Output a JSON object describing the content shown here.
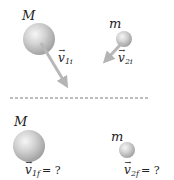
{
  "diagram": {
    "before": {
      "body_large": {
        "mass_label": "M",
        "velocity_symbol": "v",
        "velocity_subscript": "1i"
      },
      "body_small": {
        "mass_label": "m",
        "velocity_symbol": "v",
        "velocity_subscript": "2i"
      }
    },
    "separator": "dashed-line",
    "after": {
      "body_large": {
        "mass_label": "M",
        "velocity_symbol": "v",
        "velocity_subscript": "1f",
        "value": "= ?"
      },
      "body_small": {
        "mass_label": "m",
        "velocity_symbol": "v",
        "velocity_subscript": "2f",
        "value": "= ?"
      }
    },
    "colors": {
      "sphere_light": "#f4f4f4",
      "sphere_mid": "#c8c8c8",
      "sphere_dark": "#9a9a9a",
      "arrow": "#b0b0b0",
      "dash": "#777777",
      "text": "#222222"
    }
  }
}
